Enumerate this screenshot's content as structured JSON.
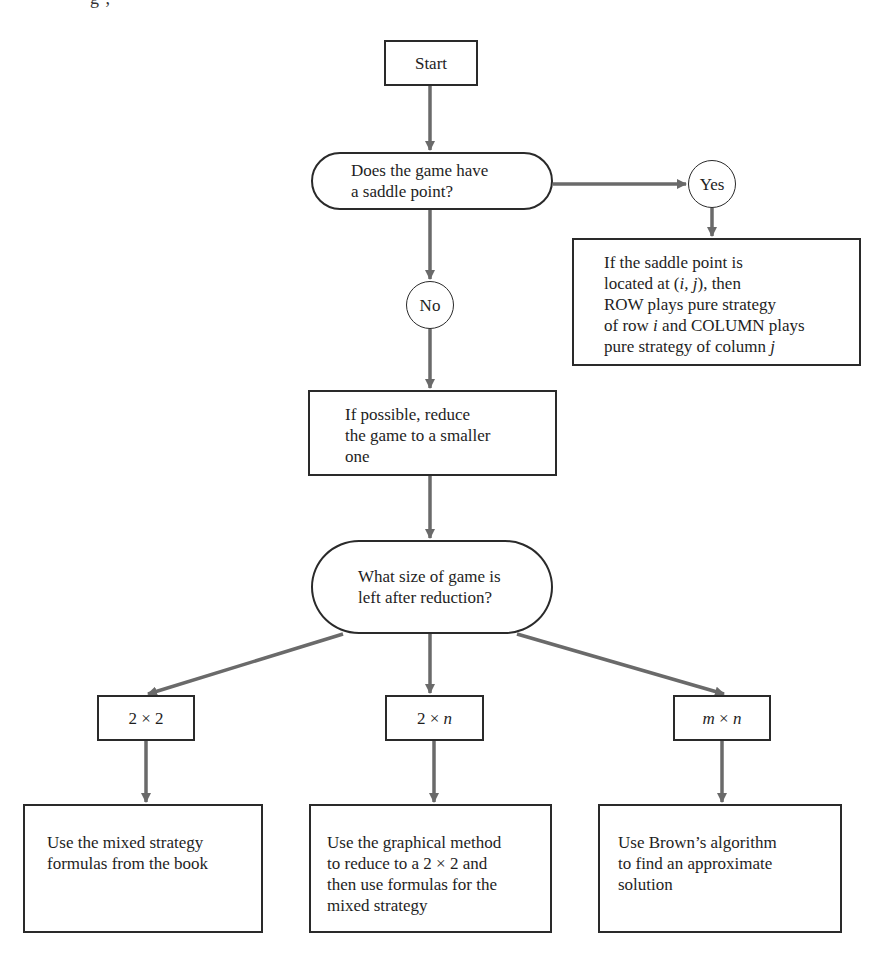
{
  "caption_fragment": "g          ,",
  "flowchart": {
    "start": {
      "label": "Start"
    },
    "decision_saddle": {
      "lines": [
        "Does the game have",
        "a saddle point?"
      ]
    },
    "yes": {
      "label": "Yes"
    },
    "no": {
      "label": "No"
    },
    "saddle_result": {
      "lines": [
        "If the saddle point is",
        "located at (i, j), then",
        "ROW plays pure strategy",
        "of row i and COLUMN plays",
        "pure strategy of column j"
      ]
    },
    "reduce": {
      "lines": [
        "If possible, reduce",
        "the game to a smaller",
        "one"
      ]
    },
    "decision_size": {
      "lines": [
        "What size of game is",
        "left after reduction?"
      ]
    },
    "sizes": [
      {
        "label": "2 × 2"
      },
      {
        "label": "2 × n"
      },
      {
        "label": "m × n"
      }
    ],
    "outcomes": [
      {
        "lines": [
          "Use the mixed strategy",
          "formulas from the book"
        ]
      },
      {
        "lines": [
          "Use the graphical method",
          "to reduce to a 2 × 2 and",
          "then use formulas for the",
          "mixed strategy"
        ]
      },
      {
        "lines": [
          "Use Brown’s algorithm",
          "to find an approximate",
          "solution"
        ]
      }
    ],
    "colors": {
      "arrow": "#6a6a6a",
      "border": "#2a2a2a",
      "text": "#1e1e1e",
      "background": "#ffffff"
    }
  }
}
